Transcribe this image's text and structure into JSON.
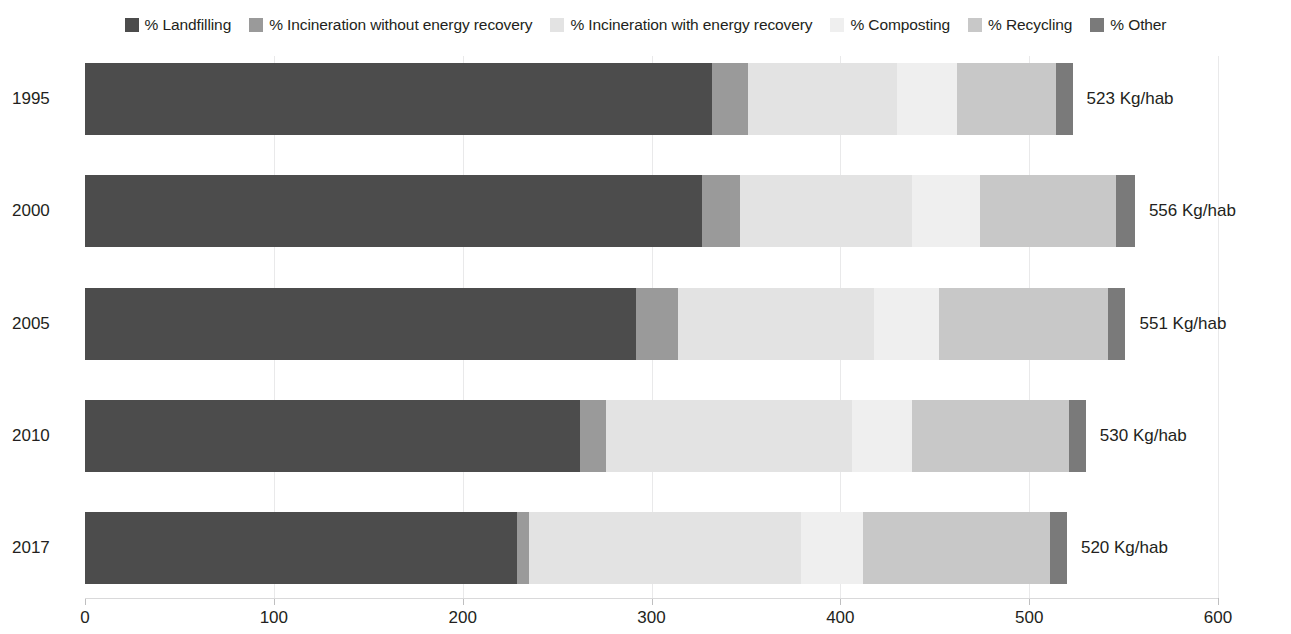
{
  "chart_data": {
    "type": "bar",
    "orientation": "horizontal",
    "stacked": true,
    "title": "",
    "xlabel": "",
    "ylabel": "",
    "categories": [
      "1995",
      "2000",
      "2005",
      "2010",
      "2017"
    ],
    "xlim": [
      0,
      600
    ],
    "xticks": [
      0,
      100,
      200,
      300,
      400,
      500,
      600
    ],
    "xtick_labels": [
      "0",
      "100",
      "200",
      "300",
      "400",
      "500",
      "600"
    ],
    "grid": true,
    "legend_position": "top",
    "units": "Kg/hab",
    "series": [
      {
        "name": "% Landfilling",
        "color": "#4c4c4c",
        "values": [
          332,
          327,
          292,
          262,
          229
        ]
      },
      {
        "name": "% Incineration without energy recovery",
        "color": "#9a9a9a",
        "values": [
          19,
          20,
          22,
          14,
          6
        ]
      },
      {
        "name": "% Incineration with energy recovery",
        "color": "#e3e3e3",
        "values": [
          79,
          91,
          104,
          130,
          144
        ]
      },
      {
        "name": "% Composting",
        "color": "#efefef",
        "values": [
          32,
          36,
          34,
          32,
          33
        ]
      },
      {
        "name": "% Recycling",
        "color": "#c8c8c8",
        "values": [
          52,
          72,
          90,
          83,
          99
        ]
      },
      {
        "name": "% Other",
        "color": "#7a7a7a",
        "values": [
          9,
          10,
          9,
          9,
          9
        ]
      }
    ],
    "bar_totals": [
      523,
      556,
      551,
      530,
      520
    ],
    "bar_total_labels": [
      "523 Kg/hab",
      "556 Kg/hab",
      "551 Kg/hab",
      "530 Kg/hab",
      "520 Kg/hab"
    ]
  },
  "legend": {
    "items": [
      {
        "label": "% Landfilling",
        "swatch": "legend-swatch-landfilling",
        "color": "#4c4c4c"
      },
      {
        "label": "% Incineration without energy recovery",
        "swatch": "legend-swatch-incineration-without-recovery",
        "color": "#9a9a9a"
      },
      {
        "label": "% Incineration with energy recovery",
        "swatch": "legend-swatch-incineration-with-recovery",
        "color": "#e3e3e3"
      },
      {
        "label": "% Composting",
        "swatch": "legend-swatch-composting",
        "color": "#efefef"
      },
      {
        "label": "% Recycling",
        "swatch": "legend-swatch-recycling",
        "color": "#c8c8c8"
      },
      {
        "label": "% Other",
        "swatch": "legend-swatch-other",
        "color": "#7a7a7a"
      }
    ]
  },
  "axis": {
    "ticks": [
      "0",
      "100",
      "200",
      "300",
      "400",
      "500",
      "600"
    ]
  },
  "rows": [
    {
      "year": "1995",
      "total_label": "523 Kg/hab"
    },
    {
      "year": "2000",
      "total_label": "556 Kg/hab"
    },
    {
      "year": "2005",
      "total_label": "551 Kg/hab"
    },
    {
      "year": "2010",
      "total_label": "530 Kg/hab"
    },
    {
      "year": "2017",
      "total_label": "520 Kg/hab"
    }
  ]
}
